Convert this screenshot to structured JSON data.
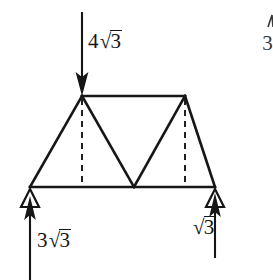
{
  "figure": {
    "kind": "statics-truss-free-body-diagram",
    "background_color": "#ffffff",
    "line_color": "#161616"
  },
  "loads": {
    "applied": {
      "label_coefficient": "4",
      "label_radical": "√",
      "label_radicand": "3",
      "direction": "down",
      "applied_at_node": "top-left-node"
    }
  },
  "reactions": {
    "left": {
      "label_coefficient": "3",
      "label_radical": "√",
      "label_radicand": "3",
      "direction": "up",
      "support_type": "pin-triangle"
    },
    "right": {
      "label_coefficient": "",
      "label_radical": "√",
      "label_radicand": "3",
      "direction": "up",
      "support_type": "pin-triangle"
    }
  },
  "corner_fragment": {
    "text": "3"
  },
  "geometry": {
    "bottom_chord": {
      "x1": 30,
      "y1": 187,
      "x2": 215,
      "y2": 187
    },
    "top_chord": {
      "x1": 82,
      "y1": 96,
      "x2": 185,
      "y2": 96
    },
    "nodes": [
      {
        "name": "bottom-left-node",
        "x": 30,
        "y": 187
      },
      {
        "name": "bottom-mid-node",
        "x": 134,
        "y": 187
      },
      {
        "name": "bottom-right-node",
        "x": 215,
        "y": 187
      },
      {
        "name": "top-left-node",
        "x": 82,
        "y": 96
      },
      {
        "name": "top-right-node",
        "x": 185,
        "y": 96
      }
    ],
    "members": [
      {
        "name": "left-diagonal",
        "from": "bottom-left-node",
        "to": "top-left-node",
        "style": "solid"
      },
      {
        "name": "top-chord",
        "from": "top-left-node",
        "to": "top-right-node",
        "style": "solid"
      },
      {
        "name": "right-diagonal",
        "from": "top-right-node",
        "to": "bottom-right-node",
        "style": "solid"
      },
      {
        "name": "bottom-chord",
        "from": "bottom-left-node",
        "to": "bottom-right-node",
        "style": "solid"
      },
      {
        "name": "web-diagonal-left",
        "from": "top-left-node",
        "to": "bottom-mid-node",
        "style": "solid"
      },
      {
        "name": "web-diagonal-right",
        "from": "bottom-mid-node",
        "to": "top-right-node",
        "style": "solid"
      },
      {
        "name": "vertical-left",
        "from": "top-left-node",
        "to": "bottom-chord",
        "style": "dashed"
      },
      {
        "name": "vertical-right",
        "from": "top-right-node",
        "to": "bottom-chord",
        "style": "dashed"
      }
    ]
  }
}
